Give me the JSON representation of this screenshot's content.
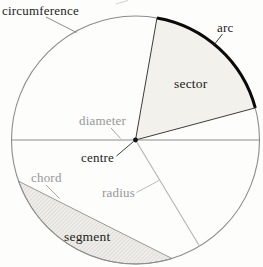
{
  "diagram": {
    "labels": {
      "circumference": "circumference",
      "arc": "arc",
      "sector": "sector",
      "diameter": "diameter",
      "centre": "centre",
      "chord": "chord",
      "radius": "radius",
      "segment": "segment"
    },
    "colors": {
      "background": "#fdfdfc",
      "black_label": "#1c1c1c",
      "gray_label": "#979797",
      "circle_outline": "#8c8c8c",
      "arc_highlight": "#0a0a0a",
      "sector_fill": "#f2f1ec",
      "sector_boundary": "#3c3c3c",
      "diameter_line": "#8c8c8c",
      "radius_line": "#b3b3b3",
      "chord_line": "#9a9a9a",
      "segment_hatch_line": "#c8c8c2",
      "segment_fill": "#efeeea",
      "centre_dot": "#111111"
    }
  }
}
